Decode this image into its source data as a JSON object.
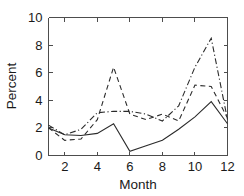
{
  "chart_data": {
    "type": "line",
    "title": "",
    "xlabel": "Month",
    "ylabel": "Percent",
    "xlim": [
      1,
      12
    ],
    "ylim": [
      0,
      10
    ],
    "xticks": [
      2,
      4,
      6,
      8,
      10,
      12
    ],
    "yticks": [
      0,
      2,
      4,
      6,
      8,
      10
    ],
    "grid": false,
    "legend": "none",
    "x": [
      1,
      2,
      3,
      4,
      5,
      6,
      7,
      8,
      9,
      10,
      11,
      12
    ],
    "series": [
      {
        "name": "series-solid",
        "style": "solid",
        "color": "#2b2b2b",
        "values": [
          2.0,
          1.5,
          1.45,
          1.6,
          2.3,
          0.3,
          0.7,
          1.1,
          1.9,
          2.8,
          3.9,
          2.3
        ]
      },
      {
        "name": "series-dashed",
        "style": "dashed",
        "color": "#2b2b2b",
        "values": [
          2.0,
          1.1,
          1.2,
          2.6,
          6.4,
          3.0,
          2.6,
          3.0,
          2.5,
          5.1,
          5.0,
          2.7
        ]
      },
      {
        "name": "series-dashdot",
        "style": "dashdot",
        "color": "#2b2b2b",
        "values": [
          2.2,
          1.5,
          1.9,
          3.1,
          3.2,
          3.2,
          3.0,
          2.5,
          3.6,
          6.4,
          8.5,
          2.6
        ]
      }
    ]
  },
  "axes": {
    "x_title": "Month",
    "y_title": "Percent",
    "x_tick_labels": [
      "2",
      "4",
      "6",
      "8",
      "10",
      "12"
    ],
    "y_tick_labels": [
      "0",
      "2",
      "4",
      "6",
      "8",
      "10"
    ]
  }
}
